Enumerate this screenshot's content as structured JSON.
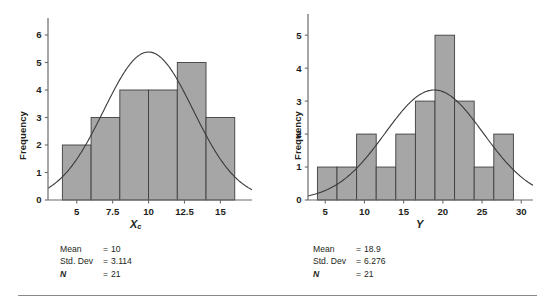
{
  "figure": {
    "title": "",
    "panels": [
      {
        "id": "left",
        "ylabel": "Frequency",
        "xlabel_main": "X",
        "xlabel_sub": "c",
        "stats": {
          "mean_label": "Mean",
          "mean_eq": "=",
          "mean_value": "10",
          "sd_label": "Std. Dev",
          "sd_eq": "=",
          "sd_value": "3.114",
          "n_label": "N",
          "n_eq": "=",
          "n_value": "21"
        }
      },
      {
        "id": "right",
        "ylabel": "Frequency",
        "xlabel_main": "Y",
        "xlabel_sub": "",
        "stats": {
          "mean_label": "Mean",
          "mean_eq": "=",
          "mean_value": "18.9",
          "sd_label": "Std. Dev",
          "sd_eq": "=",
          "sd_value": "6.276",
          "n_label": "N",
          "n_eq": "=",
          "n_value": "21"
        }
      }
    ],
    "colors": {
      "bar_fill": "#a6a6a6",
      "bar_stroke": "#3f3f3f",
      "axis": "#6b6b6b",
      "curve": "#3a3a3a",
      "text": "#231f20",
      "rule": "#8a8a8a"
    }
  },
  "chart_data": [
    {
      "type": "bar",
      "id": "histogram-xc",
      "title": "",
      "xlabel": "Xc",
      "ylabel": "Frequency",
      "grid": false,
      "legend": "none",
      "bin_edges": [
        4,
        6,
        8,
        10,
        12,
        14,
        16
      ],
      "bin_width": 2,
      "categories": [
        "4-6",
        "6-8",
        "8-10",
        "10-12",
        "12-14",
        "14-16"
      ],
      "values": [
        2,
        3,
        4,
        4,
        5,
        3
      ],
      "xlim": [
        3.0,
        17.2
      ],
      "ylim": [
        0,
        6.4
      ],
      "xticks": [
        5,
        7.5,
        10,
        12.5,
        15
      ],
      "xticklabels": [
        "5",
        "7.5",
        "10",
        "12.5",
        "15"
      ],
      "yticks": [
        0,
        1,
        2,
        3,
        4,
        5,
        6
      ],
      "yticklabels": [
        "0",
        "1",
        "2",
        "3",
        "4",
        "5",
        "6"
      ],
      "overlay": {
        "type": "normal-curve",
        "mean": 10,
        "std_dev": 3.114,
        "n": 21,
        "bin_width": 2
      },
      "annotations": {
        "Mean": "10",
        "Std. Dev": "3.114",
        "N": "21"
      }
    },
    {
      "type": "bar",
      "id": "histogram-y",
      "title": "",
      "xlabel": "Y",
      "ylabel": "Frequency",
      "grid": false,
      "legend": "none",
      "bin_edges": [
        4,
        6.5,
        9,
        11.5,
        14,
        16.5,
        19,
        21.5,
        24,
        26.5,
        29
      ],
      "bin_width": 2.5,
      "categories": [
        "4-6.5",
        "6.5-9",
        "9-11.5",
        "11.5-14",
        "14-16.5",
        "16.5-19",
        "19-21.5",
        "21.5-24",
        "24-26.5",
        "26.5-29"
      ],
      "values": [
        1,
        1,
        2,
        1,
        2,
        3,
        5,
        3,
        1,
        2
      ],
      "xlim": [
        2.8,
        31.5
      ],
      "ylim": [
        0,
        5.4
      ],
      "xticks": [
        5,
        10,
        15,
        20,
        25,
        30
      ],
      "xticklabels": [
        "5",
        "10",
        "15",
        "20",
        "25",
        "30"
      ],
      "yticks": [
        0,
        1,
        2,
        3,
        4,
        5
      ],
      "yticklabels": [
        "0",
        "1",
        "2",
        "3",
        "4",
        "5"
      ],
      "overlay": {
        "type": "normal-curve",
        "mean": 18.9,
        "std_dev": 6.276,
        "n": 21,
        "bin_width": 2.5
      },
      "annotations": {
        "Mean": "18.9",
        "Std. Dev": "6.276",
        "N": "21"
      }
    }
  ]
}
